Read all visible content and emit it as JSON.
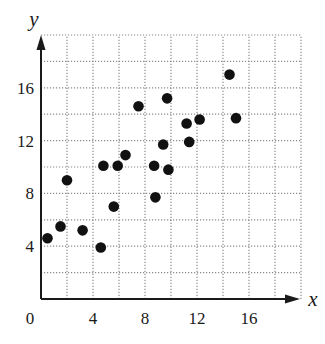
{
  "chart_data": {
    "type": "scatter",
    "title": "",
    "xlabel": "x",
    "ylabel": "y",
    "xlim": [
      0,
      20
    ],
    "ylim": [
      0,
      20
    ],
    "grid": true,
    "grid_step": 2,
    "grid_style": "dotted",
    "legend": null,
    "x_ticks": [
      0,
      4,
      8,
      12,
      16
    ],
    "y_ticks": [
      4,
      8,
      12,
      16
    ],
    "x_tick_labels": [
      "0",
      "4",
      "8",
      "12",
      "16"
    ],
    "y_tick_labels": [
      "4",
      "8",
      "12",
      "16"
    ],
    "marker_color": "#111111",
    "points": [
      {
        "x": 0.5,
        "y": 4.6
      },
      {
        "x": 1.5,
        "y": 5.5
      },
      {
        "x": 2.0,
        "y": 9.0
      },
      {
        "x": 3.2,
        "y": 5.2
      },
      {
        "x": 4.6,
        "y": 3.9
      },
      {
        "x": 4.8,
        "y": 10.1
      },
      {
        "x": 5.6,
        "y": 7.0
      },
      {
        "x": 5.9,
        "y": 10.1
      },
      {
        "x": 6.5,
        "y": 10.9
      },
      {
        "x": 7.5,
        "y": 14.6
      },
      {
        "x": 8.7,
        "y": 10.1
      },
      {
        "x": 8.8,
        "y": 7.7
      },
      {
        "x": 9.4,
        "y": 11.7
      },
      {
        "x": 9.7,
        "y": 15.2
      },
      {
        "x": 9.8,
        "y": 9.8
      },
      {
        "x": 11.2,
        "y": 13.3
      },
      {
        "x": 11.4,
        "y": 11.9
      },
      {
        "x": 12.2,
        "y": 13.6
      },
      {
        "x": 14.5,
        "y": 17.0
      },
      {
        "x": 15.0,
        "y": 13.7
      }
    ]
  },
  "labels": {
    "x_axis": "x",
    "y_axis": "y",
    "origin": "0"
  }
}
